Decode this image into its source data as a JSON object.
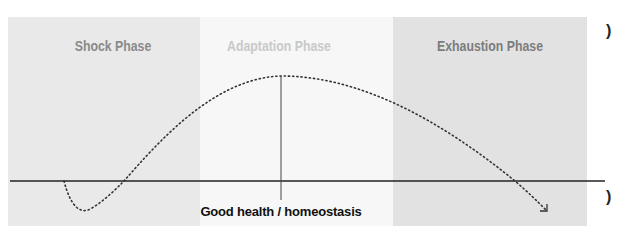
{
  "diagram": {
    "phases": [
      {
        "label": "Shock Phase",
        "x_start": 8,
        "x_end": 200,
        "fill": "#e9e9e9",
        "text_color": "#8a8a8a"
      },
      {
        "label": "Adaptation Phase",
        "x_start": 200,
        "x_end": 393,
        "fill": "#f7f7f7",
        "text_color": "#c9c9c9"
      },
      {
        "label": "Exhaustion Phase",
        "x_start": 393,
        "x_end": 587,
        "fill": "#e2e2e2",
        "text_color": "#7c7c7c"
      }
    ],
    "baseline": {
      "label": "Good health / homeostasis",
      "y": 181,
      "color": "#222222"
    },
    "curve": {
      "style": "dotted",
      "color": "#333333",
      "shape": "dip below baseline, rise to peak at adaptation midpoint, decline below baseline with arrow"
    },
    "side_glyphs": [
      ")",
      ")"
    ]
  }
}
